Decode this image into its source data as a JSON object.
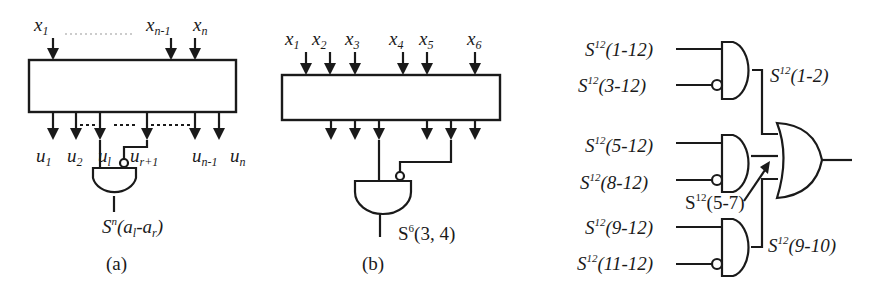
{
  "figure": {
    "panel_a": {
      "caption": "(a)",
      "inputs": [
        "x1",
        "xn-1",
        "xn"
      ],
      "input_labels": {
        "x1": {
          "base": "x",
          "sub": "1"
        },
        "xn1": {
          "base": "x",
          "sub": "n-1"
        },
        "xn": {
          "base": "x",
          "sub": "n"
        }
      },
      "output_labels": {
        "u1": {
          "base": "u",
          "sub": "1"
        },
        "u2": {
          "base": "u",
          "sub": "2"
        },
        "ul": {
          "base": "u",
          "sub": "l"
        },
        "ur1": {
          "base": "u",
          "sub": "r+1"
        },
        "un1": {
          "base": "u",
          "sub": "n-1"
        },
        "un": {
          "base": "u",
          "sub": "n"
        }
      },
      "gate_output": {
        "base": "S",
        "sup": "n",
        "args": "(a",
        "arg_sub1": "l",
        "dash": "-a",
        "arg_sub2": "r",
        "close": ")"
      }
    },
    "panel_b": {
      "caption": "(b)",
      "input_labels": {
        "x1": {
          "base": "x",
          "sub": "1"
        },
        "x2": {
          "base": "x",
          "sub": "2"
        },
        "x3": {
          "base": "x",
          "sub": "3"
        },
        "x4": {
          "base": "x",
          "sub": "4"
        },
        "x5": {
          "base": "x",
          "sub": "5"
        },
        "x6": {
          "base": "x",
          "sub": "6"
        }
      },
      "gate_output": {
        "base": "S",
        "sup": "6",
        "args": "(3, 4)"
      }
    },
    "panel_c": {
      "inputs": [
        {
          "base": "S",
          "sup": "12",
          "args": "(1-12)"
        },
        {
          "base": "S",
          "sup": "12",
          "args": "(3-12)"
        },
        {
          "base": "S",
          "sup": "12",
          "args": "(5-12)"
        },
        {
          "base": "S",
          "sup": "12",
          "args": "(8-12)"
        },
        {
          "base": "S",
          "sup": "12",
          "args": "(9-12)"
        },
        {
          "base": "S",
          "sup": "12",
          "args": "(11-12)"
        }
      ],
      "intermediate": [
        {
          "base": "S",
          "sup": "12",
          "args": "(1-2)"
        },
        {
          "base": "S",
          "sup": "12",
          "args": "(5-7)"
        },
        {
          "base": "S",
          "sup": "12",
          "args": "(9-10)"
        }
      ]
    }
  }
}
